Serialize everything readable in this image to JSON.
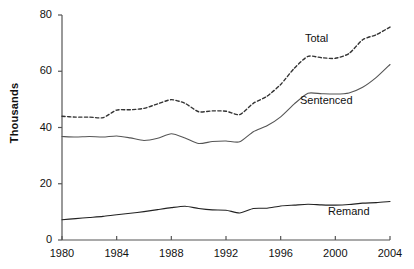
{
  "chart_data": {
    "type": "line",
    "title": "",
    "xlabel": "",
    "ylabel": "Thousands",
    "xlim": [
      1980,
      2004
    ],
    "ylim": [
      0,
      80
    ],
    "grid": false,
    "legend_position": "inline-annotations",
    "x_ticks": [
      "1980",
      "1984",
      "1988",
      "1992",
      "1996",
      "2000",
      "2004"
    ],
    "y_ticks": [
      "0",
      "20",
      "40",
      "60",
      "80"
    ],
    "x": [
      1980,
      1981,
      1982,
      1983,
      1984,
      1985,
      1986,
      1987,
      1988,
      1989,
      1990,
      1991,
      1992,
      1993,
      1994,
      1995,
      1996,
      1997,
      1998,
      1999,
      2000,
      2001,
      2002,
      2003,
      2004
    ],
    "series": [
      {
        "name": "Total",
        "style": "dashed",
        "color": "#333333",
        "values": [
          44.0,
          43.7,
          43.7,
          43.5,
          46.2,
          46.3,
          46.8,
          48.4,
          49.9,
          48.6,
          45.6,
          45.9,
          45.8,
          44.6,
          48.6,
          51.1,
          55.3,
          61.1,
          65.3,
          64.8,
          64.6,
          66.3,
          71.2,
          73.0,
          75.7
        ],
        "label_text": "Total"
      },
      {
        "name": "Sentenced",
        "style": "solid",
        "color": "#555555",
        "values": [
          36.8,
          36.6,
          36.8,
          36.6,
          37.0,
          36.3,
          35.4,
          36.2,
          37.8,
          36.3,
          34.3,
          35.0,
          35.2,
          34.9,
          38.5,
          40.6,
          43.8,
          48.4,
          52.2,
          52.0,
          51.9,
          52.3,
          54.3,
          57.8,
          62.4
        ],
        "label_text": "Sentenced"
      },
      {
        "name": "Remand",
        "style": "solid",
        "color": "#222222",
        "values": [
          7.2,
          7.6,
          8.0,
          8.4,
          9.0,
          9.5,
          10.1,
          10.8,
          11.5,
          12.0,
          11.2,
          10.7,
          10.6,
          9.6,
          11.2,
          11.3,
          12.1,
          12.4,
          12.7,
          12.5,
          12.4,
          12.6,
          13.1,
          13.3,
          13.7
        ],
        "label_text": "Remand"
      }
    ],
    "annotations": [
      {
        "text": "Total",
        "x_px": 305,
        "y_px": 33
      },
      {
        "text": "Sentenced",
        "x_px": 300,
        "y_px": 95
      },
      {
        "text": "Remand",
        "x_px": 328,
        "y_px": 206
      }
    ],
    "axis_color": "#555555"
  }
}
